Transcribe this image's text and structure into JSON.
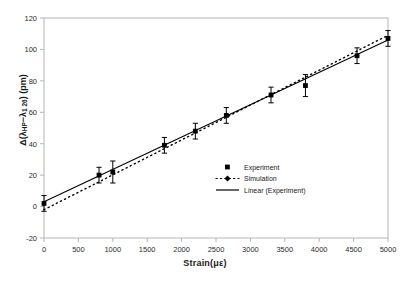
{
  "chart_data": {
    "type": "scatter",
    "title": "",
    "xlabel": "Strain(με)",
    "ylabel": "Δ(λ HP−λ 1 26) (pm)",
    "xlim": [
      0,
      5000
    ],
    "ylim": [
      -20,
      120
    ],
    "xticks": [
      0,
      500,
      1000,
      1500,
      2000,
      2500,
      3000,
      3500,
      4000,
      4500,
      5000
    ],
    "yticks": [
      -20,
      0,
      20,
      40,
      60,
      80,
      100,
      120
    ],
    "grid": false,
    "legend_position": "inside-lower-right",
    "series": [
      {
        "name": "Experiment",
        "type": "scatter-errorbar",
        "marker": "filled-square",
        "x": [
          0,
          800,
          1000,
          1750,
          2200,
          2650,
          3300,
          3800,
          4550,
          5000
        ],
        "y": [
          2,
          20,
          22,
          39,
          48,
          58,
          71,
          77,
          96,
          107
        ],
        "yerr": [
          5,
          5,
          7,
          5,
          5,
          5,
          5,
          7,
          5,
          5
        ]
      },
      {
        "name": "Simulation",
        "type": "line",
        "style": "dotted",
        "marker": "diamond",
        "x": [
          0,
          5000
        ],
        "y": [
          -2,
          109
        ]
      },
      {
        "name": "Linear (Experiment)",
        "type": "line",
        "style": "solid",
        "x": [
          0,
          5000
        ],
        "y": [
          3,
          106
        ]
      }
    ],
    "legend": [
      {
        "label": "Experiment",
        "marker": "filled-square"
      },
      {
        "label": "Simulation",
        "marker": "dotted-line-diamond"
      },
      {
        "label": "Linear (Experiment)",
        "marker": "solid-line"
      }
    ],
    "colors": {
      "data": "#000000",
      "frame": "#b0b0b0",
      "text": "#2b2b2b"
    }
  },
  "axis": {
    "x_title_main": "Strain(",
    "x_title_unit": "με",
    "x_title_close": ")",
    "y_title_delta": "Δ(",
    "y_title_lam1": "λ",
    "y_title_sub1": "HP",
    "y_title_minus": "−",
    "y_title_lam2": "λ",
    "y_title_sub2": "1 26",
    "y_title_close": ") (pm)"
  }
}
